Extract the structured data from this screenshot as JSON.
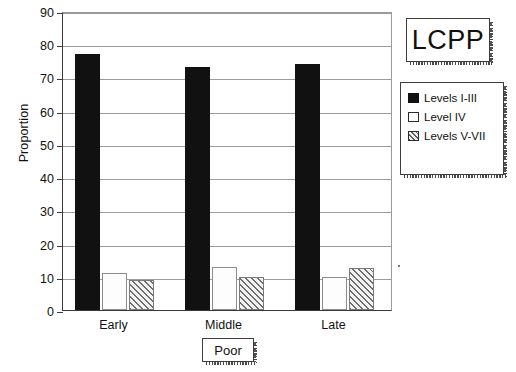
{
  "title_box": {
    "text": "LCPP"
  },
  "axis": {
    "ylabel": "Proportion",
    "xtitle": "Poor"
  },
  "legend": {
    "items": [
      {
        "label": "Levels I-III",
        "swatch": "black-filled-swatch"
      },
      {
        "label": "Level IV",
        "swatch": "white-open-swatch"
      },
      {
        "label": "Levels V-VII",
        "swatch": "hatched-swatch"
      }
    ]
  },
  "ytick_labels": [
    "90",
    "80",
    "70",
    "60",
    "50",
    "40",
    "30",
    "20",
    "10",
    "0"
  ],
  "xtick_labels": [
    "Early",
    "Middle",
    "Late"
  ],
  "chart_data": {
    "type": "bar",
    "title": "LCPP",
    "xlabel": "Poor",
    "ylabel": "Proportion",
    "categories": [
      "Early",
      "Middle",
      "Late"
    ],
    "series": [
      {
        "name": "Levels I-III",
        "values": [
          77,
          73,
          74
        ],
        "color": "#111111"
      },
      {
        "name": "Level IV",
        "values": [
          11,
          13,
          10
        ],
        "color": "#ffffff"
      },
      {
        "name": "Levels V-VII",
        "values": [
          9,
          10,
          12.5
        ],
        "color": "#cccccc"
      }
    ],
    "ylim": [
      0,
      90
    ],
    "ytick_step": 10,
    "grid": true,
    "legend_position": "right"
  }
}
